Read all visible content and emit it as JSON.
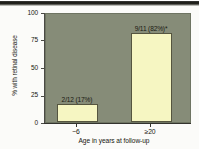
{
  "figure": {
    "background_color": "#fbfbf9",
    "plot_background_color": "#868c78",
    "bar_color": "#f6f6c2",
    "bar_edge_color": "#55553f",
    "text_color": "#16160f"
  },
  "chart_data": {
    "type": "bar",
    "title": "",
    "xlabel": "Age in years at follow-up",
    "ylabel": "% with retinal disease",
    "categories": [
      "~6",
      "≥20"
    ],
    "values": [
      17,
      82
    ],
    "ylim": [
      0,
      100
    ],
    "yticks": [
      0,
      25,
      50,
      75,
      100
    ],
    "ytick_labels": [
      "0",
      "25",
      "50",
      "75",
      "100"
    ],
    "grid": false,
    "legend": "none",
    "data_labels": [
      "2/12 (17%)",
      "9/11 (82%)*"
    ],
    "annotations": [
      {
        "series": "~6",
        "fraction": "2/12",
        "percent": 17,
        "label": "2/12 (17%)"
      },
      {
        "series": "≥20",
        "fraction": "9/11",
        "percent": 82,
        "label": "9/11 (82%)*",
        "significance_marker": "*"
      }
    ]
  }
}
